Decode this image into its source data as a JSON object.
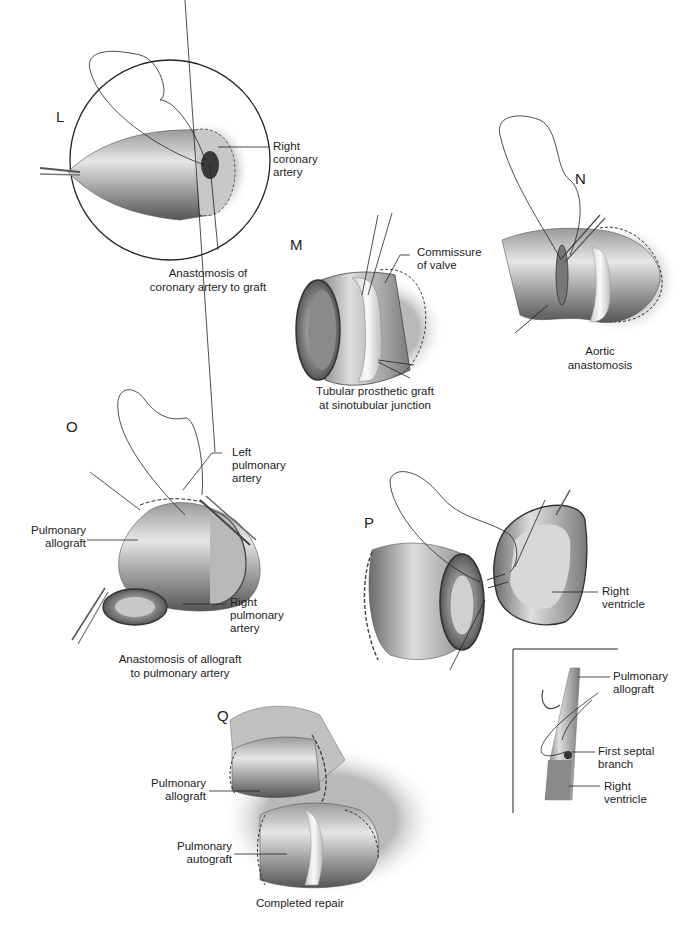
{
  "page": {
    "running_header": "",
    "figure_type": "surgical illustration sequence"
  },
  "panels": {
    "L": {
      "letter": "L",
      "labels": [
        "Right",
        "coronary",
        "artery"
      ],
      "caption": [
        "Anastomosis of",
        "coronary artery to graft"
      ]
    },
    "M": {
      "letter": "M",
      "labels": [
        "Commissure",
        "of valve"
      ],
      "caption": [
        "Tubular prosthetic graft",
        "at sinotubular junction"
      ]
    },
    "N": {
      "letter": "N",
      "caption": [
        "Aortic",
        "anastomosis"
      ]
    },
    "O": {
      "letter": "O",
      "label_left_pulmonary": [
        "Left",
        "pulmonary",
        "artery"
      ],
      "label_pulmonary_allograft": [
        "Pulmonary",
        "allograft"
      ],
      "label_right_pulmonary": [
        "Right",
        "pulmonary",
        "artery"
      ],
      "caption": [
        "Anastomosis of allograft",
        "to pulmonary artery"
      ]
    },
    "P": {
      "letter": "P",
      "label_right_ventricle": [
        "Right",
        "ventricle"
      ],
      "inset": {
        "label_pulmonary_allograft": [
          "Pulmonary",
          "allograft"
        ],
        "label_first_septal": [
          "First septal",
          "branch"
        ],
        "label_right_ventricle": [
          "Right",
          "ventricle"
        ]
      }
    },
    "Q": {
      "letter": "Q",
      "label_allograft": [
        "Pulmonary",
        "allograft"
      ],
      "label_autograft": [
        "Pulmonary",
        "autograft"
      ],
      "caption": [
        "Completed repair"
      ]
    }
  },
  "colors": {
    "ink": "#222222",
    "tissue_light": "#e8e8e8",
    "tissue_mid": "#a8a8a8",
    "tissue_dark": "#4a4a4a",
    "background": "#ffffff"
  }
}
